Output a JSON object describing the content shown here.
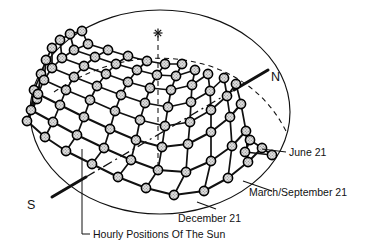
{
  "figure": {
    "kind": "sun-path-sky-dome-diagram",
    "background_color": "#ffffff",
    "ink_color": "#111111",
    "dot_fill_color": "#d2d2d2",
    "dot_stroke_color": "#000000"
  },
  "labels": {
    "north": "N",
    "south": "S",
    "june": "June 21",
    "march_september": "March/September 21",
    "december": "December 21",
    "caption": "Hourly Positions Of The Sun"
  },
  "geometry": {
    "dome": {
      "cx": 160,
      "cy": 112,
      "rx": 130,
      "ry": 102
    },
    "zenith_marker": {
      "x": 158,
      "y": 33,
      "glyph": "asterisk"
    },
    "zenith_line": {
      "x1": 158,
      "y1": 36,
      "x2": 158,
      "y2": 170
    },
    "polar_axis": {
      "x1": 52,
      "y1": 197,
      "x2": 268,
      "y2": 70
    },
    "north_label_pos": {
      "x": 272,
      "y": 76
    },
    "south_label_pos": {
      "x": 30,
      "y": 204
    }
  },
  "chart_data": {
    "type": "scatter",
    "title": "Hourly Positions Of The Sun",
    "xlabel": "",
    "ylabel": "",
    "grid": false,
    "legend_position": "right",
    "annotations": [
      "N",
      "S",
      "June 21",
      "March/September 21",
      "December 21",
      "Hourly Positions Of The Sun"
    ],
    "series": [
      {
        "name": "June 21",
        "role": "summer-solstice-path",
        "hour_points": [
          [
            37,
            99
          ],
          [
            27,
            121
          ],
          [
            45,
            137
          ],
          [
            66,
            151
          ],
          [
            92,
            164
          ],
          [
            118,
            177
          ],
          [
            146,
            188
          ],
          [
            174,
            195
          ],
          [
            204,
            191
          ],
          [
            228,
            178
          ],
          [
            248,
            162
          ],
          [
            262,
            148
          ],
          [
            272,
            155
          ]
        ]
      },
      {
        "name": "March/September 21",
        "role": "equinox-path",
        "hour_points": [
          [
            34,
            90
          ],
          [
            31,
            110
          ],
          [
            53,
            122
          ],
          [
            77,
            135
          ],
          [
            104,
            148
          ],
          [
            131,
            160
          ],
          [
            158,
            170
          ],
          [
            186,
            172
          ],
          [
            211,
            161
          ],
          [
            232,
            146
          ],
          [
            246,
            131
          ],
          [
            250,
            140
          ],
          [
            245,
            152
          ]
        ]
      },
      {
        "name": "December 21",
        "role": "winter-solstice-path",
        "hour_points": [
          [
            41,
            74
          ],
          [
            38,
            94
          ],
          [
            60,
            105
          ],
          [
            84,
            117
          ],
          [
            110,
            129
          ],
          [
            136,
            140
          ],
          [
            162,
            147
          ],
          [
            188,
            144
          ],
          [
            211,
            132
          ],
          [
            230,
            117
          ],
          [
            241,
            104
          ]
        ]
      },
      {
        "name": "path-upper-1",
        "role": "intermediate-path",
        "hour_points": [
          [
            46,
            60
          ],
          [
            44,
            80
          ],
          [
            66,
            90
          ],
          [
            90,
            100
          ],
          [
            115,
            111
          ],
          [
            140,
            120
          ],
          [
            165,
            126
          ],
          [
            190,
            122
          ],
          [
            211,
            110
          ],
          [
            227,
            96
          ],
          [
            236,
            84
          ]
        ]
      },
      {
        "name": "path-upper-2",
        "role": "intermediate-path",
        "hour_points": [
          [
            52,
            48
          ],
          [
            52,
            68
          ],
          [
            74,
            77
          ],
          [
            97,
            86
          ],
          [
            121,
            95
          ],
          [
            145,
            103
          ],
          [
            168,
            107
          ],
          [
            191,
            102
          ],
          [
            210,
            91
          ],
          [
            224,
            78
          ]
        ]
      },
      {
        "name": "path-upper-3",
        "role": "intermediate-path",
        "hour_points": [
          [
            60,
            40
          ],
          [
            62,
            58
          ],
          [
            84,
            66
          ],
          [
            106,
            74
          ],
          [
            128,
            82
          ],
          [
            150,
            88
          ],
          [
            171,
            90
          ],
          [
            192,
            85
          ],
          [
            208,
            74
          ]
        ]
      },
      {
        "name": "path-upper-4",
        "role": "intermediate-path",
        "hour_points": [
          [
            70,
            34
          ],
          [
            74,
            50
          ],
          [
            95,
            57
          ],
          [
            116,
            64
          ],
          [
            137,
            70
          ],
          [
            157,
            75
          ],
          [
            176,
            76
          ],
          [
            195,
            70
          ]
        ]
      },
      {
        "name": "path-upper-5",
        "role": "intermediate-path",
        "hour_points": [
          [
            82,
            31
          ],
          [
            88,
            44
          ],
          [
            108,
            50
          ],
          [
            128,
            56
          ],
          [
            147,
            61
          ],
          [
            165,
            64
          ],
          [
            182,
            64
          ]
        ]
      }
    ],
    "hour_lines": [
      {
        "name": "hour-line-0",
        "indices": [
          0,
          0,
          0,
          0,
          0,
          0,
          0,
          0
        ]
      },
      {
        "name": "hour-line-1",
        "indices": [
          1,
          1,
          1,
          1,
          1,
          1,
          1,
          1
        ]
      },
      {
        "name": "hour-line-2",
        "indices": [
          2,
          2,
          2,
          2,
          2,
          2,
          2,
          2
        ]
      },
      {
        "name": "hour-line-3",
        "indices": [
          3,
          3,
          3,
          3,
          3,
          3,
          3,
          3
        ]
      },
      {
        "name": "hour-line-4",
        "indices": [
          4,
          4,
          4,
          4,
          4,
          4,
          4,
          4
        ]
      },
      {
        "name": "hour-line-5",
        "indices": [
          5,
          5,
          5,
          5,
          5,
          5,
          5,
          5
        ]
      },
      {
        "name": "hour-line-6",
        "indices": [
          6,
          6,
          6,
          6,
          6,
          6,
          6,
          6
        ]
      },
      {
        "name": "hour-line-7",
        "indices": [
          7,
          7,
          7,
          7,
          7,
          7
        ]
      },
      {
        "name": "hour-line-8",
        "indices": [
          8,
          8,
          8,
          8,
          8
        ]
      },
      {
        "name": "hour-line-9",
        "indices": [
          9,
          9,
          9,
          9
        ]
      },
      {
        "name": "hour-line-10",
        "indices": [
          10,
          10,
          10
        ]
      }
    ],
    "leaders": [
      {
        "name": "june-leader",
        "from": [
          262,
          148
        ],
        "to": [
          283,
          148
        ]
      },
      {
        "name": "march-september-leader",
        "from": [
          245,
          182
        ],
        "to": [
          271,
          189
        ]
      },
      {
        "name": "december-leader",
        "from": [
          196,
          203
        ],
        "to": [
          215,
          209
        ]
      },
      {
        "name": "caption-leader",
        "from": [
          82,
          148
        ],
        "to": [
          82,
          234
        ]
      }
    ]
  }
}
